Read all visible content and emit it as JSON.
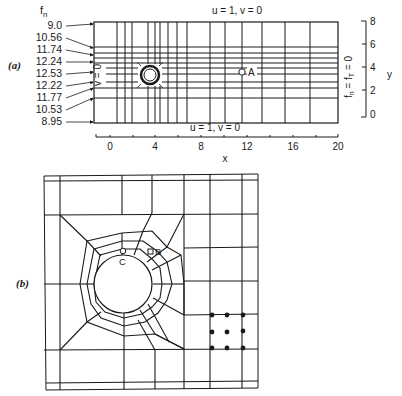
{
  "figure_a": {
    "label": "(a)",
    "fn_header": "f",
    "fn_header_sub": "n",
    "fn_values": [
      "9.0",
      "10.56",
      "11.74",
      "12.24",
      "12.53",
      "12.22",
      "11.77",
      "10.53",
      "8.95"
    ],
    "top_bc": "u = 1, v = 0",
    "bottom_bc": "u = 1, v = 0",
    "left_bc": "v = 0",
    "right_bc": "fₙ = fᴛ = 0",
    "right_bc_parts": {
      "f1": "f",
      "s1": "n",
      "eq1": " = f",
      "s2": "T",
      "eq2": " = 0"
    },
    "point_a": "A",
    "x_axis": {
      "label": "x",
      "ticks": [
        "0",
        "4",
        "8",
        "12",
        "16",
        "20"
      ]
    },
    "y_axis": {
      "label": "y",
      "ticks": [
        "8",
        "6",
        "4",
        "2",
        "0"
      ]
    }
  },
  "figure_b": {
    "label": "(b)",
    "point_b": "B",
    "point_c": "C"
  }
}
